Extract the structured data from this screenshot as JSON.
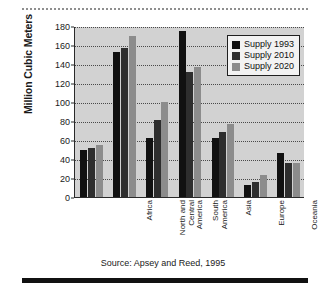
{
  "chart_data": {
    "type": "bar",
    "title": "",
    "xlabel": "",
    "ylabel": "Million Cubic Meters",
    "ylim": [
      0,
      180
    ],
    "yticks": [
      0,
      20,
      40,
      60,
      80,
      100,
      120,
      140,
      160,
      180
    ],
    "grid": true,
    "legend_position": "top-right",
    "categories": [
      "Africa",
      "North and\nCentral\nAmerica",
      "South\nAmerica",
      "Asia",
      "Europe",
      "Oceania",
      "CIS"
    ],
    "series": [
      {
        "name": "Supply 1993",
        "color": "#111111",
        "values": [
          49,
          153,
          62,
          175,
          62,
          13,
          46
        ]
      },
      {
        "name": "Supply 2010",
        "color": "#2e2e2e",
        "values": [
          52,
          157,
          81,
          132,
          68,
          16,
          36
        ]
      },
      {
        "name": "Supply 2020",
        "color": "#8c8c8c",
        "values": [
          55,
          169,
          100,
          137,
          77,
          23,
          36
        ]
      }
    ],
    "source_note": "Source: Apsey and Reed, 1995"
  }
}
